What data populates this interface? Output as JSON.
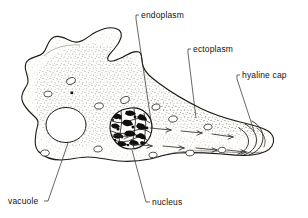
{
  "figure": {
    "background_color": "#ffffff",
    "ink_color": "#1d1a16",
    "labels": [
      {
        "id": "endoplasm",
        "text": "endoplasm",
        "x": 141,
        "y": 18,
        "anchor": "start"
      },
      {
        "id": "ectoplasm",
        "text": "ectoplasm",
        "x": 193,
        "y": 52,
        "anchor": "start"
      },
      {
        "id": "hyaline_cap",
        "text": "hyaline cap",
        "x": 242,
        "y": 78,
        "anchor": "start"
      },
      {
        "id": "vacuole",
        "text": "vacuole",
        "x": 8,
        "y": 204,
        "anchor": "start"
      },
      {
        "id": "nucleus",
        "text": "nucleus",
        "x": 152,
        "y": 205,
        "anchor": "start"
      }
    ],
    "structures": [
      {
        "id": "cell-membrane",
        "name": "cell membrane outline"
      },
      {
        "id": "ectoplasm-layer",
        "name": "ectoplasm clear outer layer"
      },
      {
        "id": "endoplasm-region",
        "name": "endoplasm granular inner region"
      },
      {
        "id": "contractile-vacuole",
        "name": "large contractile vacuole"
      },
      {
        "id": "nucleus",
        "name": "nucleus with chromatin"
      },
      {
        "id": "food-vacuoles",
        "name": "small food vacuoles"
      },
      {
        "id": "hyaline-cap",
        "name": "hyaline cap at pseudopod tip"
      },
      {
        "id": "streaming-arrows",
        "name": "cytoplasmic streaming arrows"
      }
    ]
  }
}
